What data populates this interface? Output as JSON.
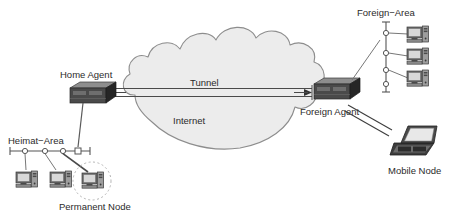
{
  "diagram": {
    "colors": {
      "background": "#ffffff",
      "cloud_fill": "#ececec",
      "cloud_stroke": "#8d8d8d",
      "router_top": "#8e8e8e",
      "router_front": "#3f3f3f",
      "router_side": "#2b2b2b",
      "computer_gray": "#9a9a9a",
      "computer_dark": "#4a4a4a",
      "line": "#555555",
      "text": "#2b2b2b",
      "highlight_circle": "#b5b5b5"
    },
    "labels": {
      "home_agent": "Home Agent",
      "foreign_agent": "Foreign Agent",
      "tunnel": "Tunnel",
      "internet": "Internet",
      "heimat_area": "Heimat−Area",
      "foreign_area": "Foreign−Area",
      "permanent_node": "Permanent Node",
      "mobile_node": "Mobile Node"
    },
    "nodes": [
      {
        "id": "home-agent",
        "type": "router",
        "label": "Home Agent"
      },
      {
        "id": "foreign-agent",
        "type": "router",
        "label": "Foreign Agent"
      },
      {
        "id": "internet-cloud",
        "type": "cloud",
        "label": "Internet"
      },
      {
        "id": "mobile-node",
        "type": "laptop",
        "label": "Mobile Node"
      },
      {
        "id": "permanent-node",
        "type": "computer",
        "label": "Permanent Node",
        "highlighted": true
      }
    ],
    "segments": [
      {
        "id": "heimat-area-bus",
        "label": "Heimat−Area",
        "orientation": "horizontal",
        "host_count": 3,
        "tap_count": 4
      },
      {
        "id": "foreign-area-bus",
        "label": "Foreign−Area",
        "orientation": "vertical",
        "host_count": 3,
        "tap_count": 4
      }
    ],
    "links": [
      {
        "id": "tunnel-link",
        "from": "home-agent",
        "to": "foreign-agent",
        "label": "Tunnel",
        "style": "double-line",
        "arrows": "both"
      },
      {
        "id": "home-agent-to-heimat",
        "from": "home-agent",
        "to": "heimat-area-bus",
        "style": "single-line"
      },
      {
        "id": "foreign-agent-to-foreign-area",
        "from": "foreign-agent",
        "to": "foreign-area-bus",
        "style": "single-line"
      },
      {
        "id": "foreign-agent-to-mobile-node",
        "from": "foreign-agent",
        "to": "mobile-node",
        "style": "double-line"
      }
    ]
  }
}
